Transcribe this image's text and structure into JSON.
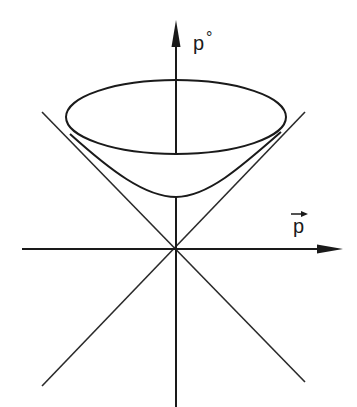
{
  "diagram": {
    "colors": {
      "line": "#1a1a1a",
      "background": "#ffffff"
    },
    "axes": {
      "vertical": {
        "label": "p",
        "superscript": "°"
      },
      "horizontal": {
        "label": "p",
        "vector_arrow": true
      }
    },
    "elements": [
      "vertical-axis-with-arrow",
      "horizontal-axis-with-arrow",
      "light-cone-asymptotes",
      "hyperboloid-upper-sheet",
      "ellipse-rim"
    ]
  }
}
